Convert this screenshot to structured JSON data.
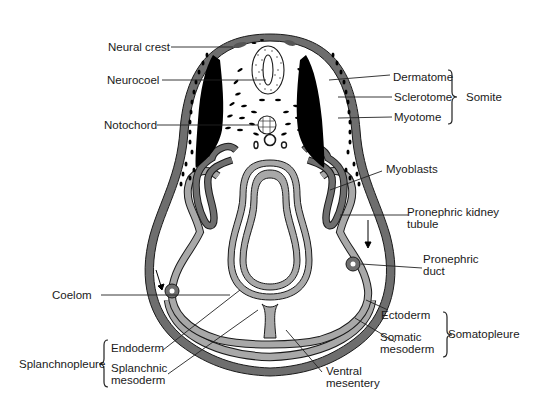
{
  "diagram": {
    "colors": {
      "ectoderm": "#6e6e6e",
      "mesoderm": "#a8a8a8",
      "endoderm": "#a8a8a8",
      "outline": "#1a1a1a",
      "myotome": "#000000",
      "background": "#ffffff"
    },
    "labels": {
      "neural_crest": "Neural crest",
      "neurocoel": "Neurocoel",
      "notochord": "Notochord",
      "dermatome": "Dermatome",
      "sclerotome": "Sclerotome",
      "myotome": "Myotome",
      "somite": "Somite",
      "myoblasts": "Myoblasts",
      "pronephric_kidney_tubule_1": "Pronephric kidney",
      "pronephric_kidney_tubule_2": "tubule",
      "pronephric_duct_1": "Pronephric",
      "pronephric_duct_2": "duct",
      "coelom": "Coelom",
      "ectoderm": "Ectoderm",
      "somatic_mesoderm_1": "Somatic",
      "somatic_mesoderm_2": "mesoderm",
      "somatopleure": "Somatopleure",
      "endoderm": "Endoderm",
      "splanchnic_mesoderm_1": "Splanchnic",
      "splanchnic_mesoderm_2": "mesoderm",
      "splanchnopleure": "Splanchnopleure",
      "ventral_mesentery_1": "Ventral",
      "ventral_mesentery_2": "mesentery"
    },
    "groups": [
      {
        "name": "Somite",
        "members": [
          "Dermatome",
          "Sclerotome",
          "Myotome"
        ]
      },
      {
        "name": "Somatopleure",
        "members": [
          "Ectoderm",
          "Somatic mesoderm"
        ]
      },
      {
        "name": "Splanchnopleure",
        "members": [
          "Endoderm",
          "Splanchnic mesoderm"
        ]
      }
    ]
  }
}
